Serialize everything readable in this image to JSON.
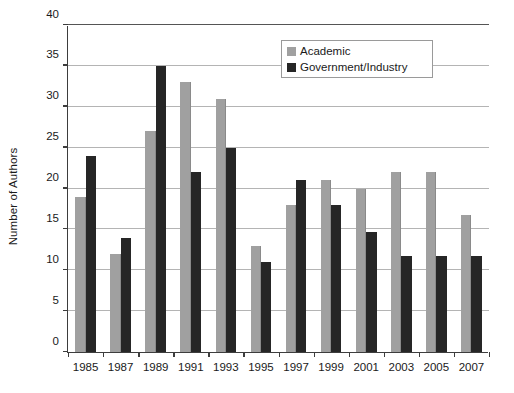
{
  "chart_data": {
    "type": "bar",
    "title": "",
    "xlabel": "",
    "ylabel": "Number of Authors",
    "ylim": [
      0,
      40
    ],
    "ytick_step": 5,
    "yticks": [
      0,
      5,
      10,
      15,
      20,
      25,
      30,
      35,
      40
    ],
    "grid": true,
    "grid_axis": "y",
    "legend_position": "top-right-inside",
    "categories": [
      "1985",
      "1987",
      "1989",
      "1991",
      "1993",
      "1995",
      "1997",
      "1999",
      "2001",
      "2003",
      "2005",
      "2007"
    ],
    "series": [
      {
        "name": "Academic",
        "color": "#a0a0a0",
        "values": [
          19,
          12,
          27,
          33,
          31,
          13,
          18,
          21,
          20,
          22,
          22,
          16.8
        ]
      },
      {
        "name": "Government/Industry",
        "color": "#262626",
        "values": [
          24,
          14,
          35,
          22,
          25,
          11,
          21,
          18,
          14.7,
          11.8,
          11.8,
          11.8
        ]
      }
    ]
  },
  "axes": {
    "y_title": "Number of Authors",
    "y_tick_labels": [
      "0",
      "5",
      "10",
      "15",
      "20",
      "25",
      "30",
      "35",
      "40"
    ],
    "x_tick_labels": [
      "1985",
      "1987",
      "1989",
      "1991",
      "1993",
      "1995",
      "1997",
      "1999",
      "2001",
      "2003",
      "2005",
      "2007"
    ]
  },
  "legend": {
    "entries": [
      {
        "label": "Academic",
        "color": "#a0a0a0"
      },
      {
        "label": "Government/Industry",
        "color": "#262626"
      }
    ]
  }
}
